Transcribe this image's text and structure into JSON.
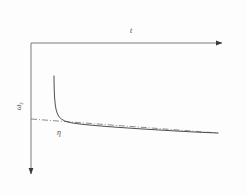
{
  "figure": {
    "background_color": "#fdfdfd",
    "ink_color": "#6b6b6b",
    "curve_color": "#555555",
    "label_color": "#4a4a4a",
    "x_axis": {
      "label": "t",
      "label_x": 130,
      "label_y": 33,
      "origin_x": 31,
      "origin_y": 43,
      "end_x": 226,
      "arrow": "right-arrow"
    },
    "y_axis": {
      "label_main": "ω",
      "label_sub": "z",
      "label_x": 21,
      "label_y": 110,
      "origin_x": 31,
      "origin_y": 43,
      "end_y": 178,
      "arrow": "down-arrow",
      "direction": "downward"
    },
    "asymptote_label": {
      "text": "η",
      "x": 57,
      "y": 135
    }
  },
  "chart_data": {
    "type": "line",
    "title": "",
    "xlabel": "t",
    "ylabel": "ωz",
    "xlim": [
      31,
      226
    ],
    "ylim_pixels_top_to_bottom": [
      43,
      178
    ],
    "grid": false,
    "legend": null,
    "axis_direction_note": "vertical axis increases downward",
    "annotations": [
      {
        "text": "t",
        "role": "x-axis-label"
      },
      {
        "text": "ωz",
        "role": "y-axis-label"
      },
      {
        "text": "η",
        "role": "asymptote-label"
      }
    ],
    "series": [
      {
        "name": "omega-z-curve",
        "style": "solid",
        "description": "steep vertical branch near t0 decaying to a slowly drifting tail",
        "points": [
          [
            54.0,
            76.0
          ],
          [
            54.1,
            84.0
          ],
          [
            54.3,
            92.0
          ],
          [
            54.7,
            99.0
          ],
          [
            55.3,
            105.0
          ],
          [
            56.2,
            110.0
          ],
          [
            57.5,
            114.0
          ],
          [
            59.2,
            117.0
          ],
          [
            61.5,
            119.2
          ],
          [
            64.5,
            120.8
          ],
          [
            68.0,
            122.0
          ],
          [
            72.0,
            122.9
          ],
          [
            78.0,
            123.8
          ],
          [
            86.0,
            124.7
          ],
          [
            96.0,
            125.6
          ],
          [
            108.0,
            126.6
          ],
          [
            122.0,
            127.6
          ],
          [
            138.0,
            128.7
          ],
          [
            156.0,
            129.8
          ],
          [
            176.0,
            131.0
          ],
          [
            196.0,
            132.1
          ],
          [
            218.0,
            133.0
          ]
        ]
      },
      {
        "name": "eta-asymptote-line",
        "style": "dash-dot",
        "description": "straight reference line meeting the curve tail",
        "points": [
          [
            31.0,
            119.0
          ],
          [
            218.0,
            133.0
          ]
        ]
      }
    ]
  }
}
